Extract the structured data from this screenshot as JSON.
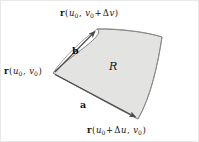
{
  "figure": {
    "background_color": "#ffffff",
    "region": {
      "fill_color": "#e3e3e1",
      "stroke_color": "#6e6e6e",
      "label": "R"
    },
    "vectors": [
      {
        "name": "a",
        "label": "a",
        "from": "r-u0-v0",
        "to": "r-u0-du-v0"
      },
      {
        "name": "b",
        "label": "b",
        "from": "r-u0-v0",
        "to": "r-u0-v0-dv"
      }
    ],
    "points": [
      {
        "id": "r-u0-v0-dv",
        "position": "top",
        "text": "r (u0, v0 + Δv)",
        "parts": {
          "vector": "r",
          "open": "(",
          "u": "u",
          "u_sub": "0",
          "comma": ", ",
          "v": "v",
          "v_sub": "0",
          "plus": "+",
          "delta": "Δ",
          "dv": "v",
          "close": ")"
        }
      },
      {
        "id": "r-u0-v0",
        "position": "left",
        "text": "r (u0, v0)",
        "parts": {
          "vector": "r",
          "open": "(",
          "u": "u",
          "u_sub": "0",
          "comma": ", ",
          "v": "v",
          "v_sub": "0",
          "close": ")"
        }
      },
      {
        "id": "r-u0-du-v0",
        "position": "bottom-right",
        "text": "r (u0 + Δu, v0)",
        "parts": {
          "vector": "r",
          "open": "(",
          "u": "u",
          "u_sub": "0",
          "plus": "+",
          "delta": "Δ",
          "du": "u",
          "comma": ", ",
          "v": "v",
          "v_sub": "0",
          "close": ")"
        }
      }
    ]
  }
}
